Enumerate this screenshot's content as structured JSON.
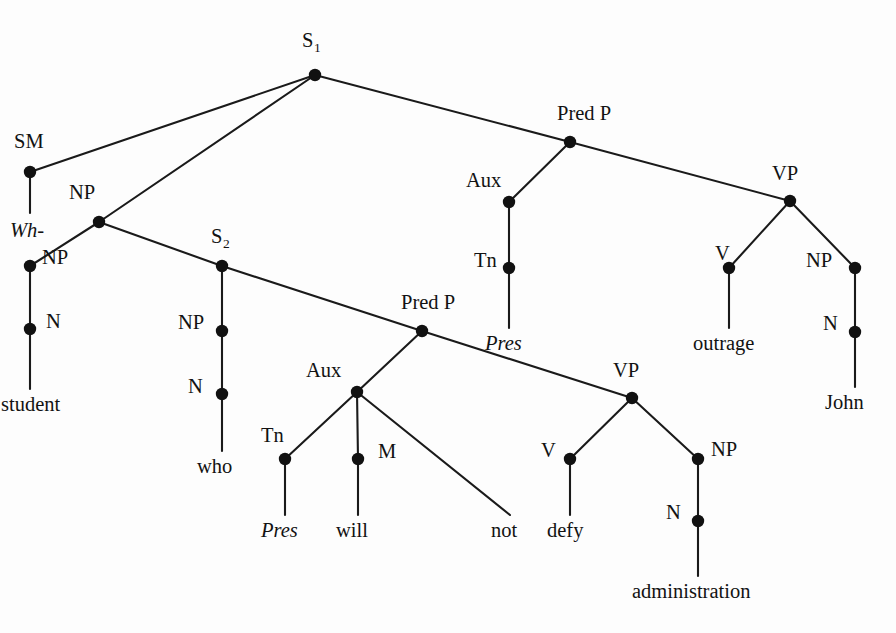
{
  "figure": {
    "background_color": "#fdfdfd",
    "line_color": "#1a1a1a",
    "node_color": "#111111",
    "sentence": "Wh- student who Pres will not defy administration Pres outrage John"
  },
  "nodes": {
    "s1": {
      "label": "S",
      "subscript": "1",
      "x": 315,
      "y": 75,
      "label_x": 302,
      "label_y": 30
    },
    "sm": {
      "label": "SM",
      "subscript": "",
      "x": 30,
      "y": 172,
      "label_x": 14,
      "label_y": 131
    },
    "np_upper": {
      "label": "NP",
      "subscript": "",
      "x": 99,
      "y": 222,
      "label_x": 69,
      "label_y": 182
    },
    "np_mid": {
      "label": "NP",
      "subscript": "",
      "x": 30,
      "y": 266,
      "label_x": 42,
      "label_y": 247
    },
    "n_student": {
      "label": "N",
      "subscript": "",
      "x": 30,
      "y": 329,
      "label_x": 46,
      "label_y": 311
    },
    "s2": {
      "label": "S",
      "subscript": "2",
      "x": 222,
      "y": 266,
      "label_x": 211,
      "label_y": 226
    },
    "np_who": {
      "label": "NP",
      "subscript": "",
      "x": 222,
      "y": 331,
      "label_x": 178,
      "label_y": 312
    },
    "n_who": {
      "label": "N",
      "subscript": "",
      "x": 222,
      "y": 394,
      "label_x": 188,
      "label_y": 376
    },
    "predp_emb": {
      "label": "Pred P",
      "subscript": "",
      "x": 422,
      "y": 331,
      "label_x": 401,
      "label_y": 292
    },
    "aux_emb": {
      "label": "Aux",
      "subscript": "",
      "x": 357,
      "y": 392,
      "label_x": 306,
      "label_y": 360
    },
    "tn_emb": {
      "label": "Tn",
      "subscript": "",
      "x": 285,
      "y": 459,
      "label_x": 261,
      "label_y": 425
    },
    "m_emb": {
      "label": "M",
      "subscript": "",
      "x": 358,
      "y": 459,
      "label_x": 378,
      "label_y": 441
    },
    "vp_emb": {
      "label": "VP",
      "subscript": "",
      "x": 632,
      "y": 398,
      "label_x": 613,
      "label_y": 360
    },
    "v_defy": {
      "label": "V",
      "subscript": "",
      "x": 570,
      "y": 459,
      "label_x": 541,
      "label_y": 440
    },
    "np_admin": {
      "label": "NP",
      "subscript": "",
      "x": 698,
      "y": 459,
      "label_x": 711,
      "label_y": 439
    },
    "n_admin": {
      "label": "N",
      "subscript": "",
      "x": 698,
      "y": 521,
      "label_x": 666,
      "label_y": 502
    },
    "predp_main": {
      "label": "Pred P",
      "subscript": "",
      "x": 570,
      "y": 142,
      "label_x": 557,
      "label_y": 103
    },
    "aux_main": {
      "label": "Aux",
      "subscript": "",
      "x": 509,
      "y": 202,
      "label_x": 466,
      "label_y": 170
    },
    "tn_main": {
      "label": "Tn",
      "subscript": "",
      "x": 509,
      "y": 268,
      "label_x": 474,
      "label_y": 250
    },
    "vp_main": {
      "label": "VP",
      "subscript": "",
      "x": 790,
      "y": 201,
      "label_x": 772,
      "label_y": 163
    },
    "v_outrage": {
      "label": "V",
      "subscript": "",
      "x": 729,
      "y": 268,
      "label_x": 715,
      "label_y": 243
    },
    "np_john": {
      "label": "NP",
      "subscript": "",
      "x": 855,
      "y": 268,
      "label_x": 806,
      "label_y": 250
    },
    "n_john": {
      "label": "N",
      "subscript": "",
      "x": 855,
      "y": 332,
      "label_x": 823,
      "label_y": 313
    }
  },
  "edges": [
    {
      "from": "s1",
      "to": "sm",
      "x1": 315,
      "y1": 75,
      "x2": 30,
      "y2": 172
    },
    {
      "from": "s1",
      "to": "np_upper",
      "x1": 315,
      "y1": 75,
      "x2": 99,
      "y2": 222
    },
    {
      "from": "s1",
      "to": "predp_main",
      "x1": 315,
      "y1": 75,
      "x2": 570,
      "y2": 142
    },
    {
      "from": "sm",
      "to": "wh",
      "x1": 30,
      "y1": 172,
      "x2": 30,
      "y2": 213
    },
    {
      "from": "np_upper",
      "to": "np_mid",
      "x1": 99,
      "y1": 222,
      "x2": 30,
      "y2": 266
    },
    {
      "from": "np_upper",
      "to": "s2",
      "x1": 99,
      "y1": 222,
      "x2": 222,
      "y2": 266
    },
    {
      "from": "np_mid",
      "to": "n_student",
      "x1": 30,
      "y1": 266,
      "x2": 30,
      "y2": 329
    },
    {
      "from": "n_student",
      "to": "student",
      "x1": 30,
      "y1": 329,
      "x2": 30,
      "y2": 389
    },
    {
      "from": "s2",
      "to": "np_who",
      "x1": 222,
      "y1": 266,
      "x2": 222,
      "y2": 331
    },
    {
      "from": "s2",
      "to": "predp_emb",
      "x1": 222,
      "y1": 266,
      "x2": 422,
      "y2": 331
    },
    {
      "from": "np_who",
      "to": "n_who",
      "x1": 222,
      "y1": 331,
      "x2": 222,
      "y2": 394
    },
    {
      "from": "n_who",
      "to": "who",
      "x1": 222,
      "y1": 394,
      "x2": 222,
      "y2": 451
    },
    {
      "from": "predp_emb",
      "to": "aux_emb",
      "x1": 422,
      "y1": 331,
      "x2": 357,
      "y2": 392
    },
    {
      "from": "predp_emb",
      "to": "vp_emb",
      "x1": 422,
      "y1": 331,
      "x2": 632,
      "y2": 398
    },
    {
      "from": "aux_emb",
      "to": "tn_emb",
      "x1": 357,
      "y1": 392,
      "x2": 285,
      "y2": 459
    },
    {
      "from": "aux_emb",
      "to": "m_emb",
      "x1": 357,
      "y1": 392,
      "x2": 358,
      "y2": 459
    },
    {
      "from": "aux_emb",
      "to": "not",
      "x1": 357,
      "y1": 392,
      "x2": 510,
      "y2": 515
    },
    {
      "from": "tn_emb",
      "to": "pres_emb",
      "x1": 285,
      "y1": 459,
      "x2": 285,
      "y2": 515
    },
    {
      "from": "m_emb",
      "to": "will",
      "x1": 358,
      "y1": 459,
      "x2": 358,
      "y2": 515
    },
    {
      "from": "vp_emb",
      "to": "v_defy",
      "x1": 632,
      "y1": 398,
      "x2": 570,
      "y2": 459
    },
    {
      "from": "vp_emb",
      "to": "np_admin",
      "x1": 632,
      "y1": 398,
      "x2": 698,
      "y2": 459
    },
    {
      "from": "v_defy",
      "to": "defy",
      "x1": 570,
      "y1": 459,
      "x2": 570,
      "y2": 515
    },
    {
      "from": "np_admin",
      "to": "n_admin",
      "x1": 698,
      "y1": 459,
      "x2": 698,
      "y2": 521
    },
    {
      "from": "n_admin",
      "to": "administration",
      "x1": 698,
      "y1": 521,
      "x2": 698,
      "y2": 576
    },
    {
      "from": "predp_main",
      "to": "aux_main",
      "x1": 570,
      "y1": 142,
      "x2": 509,
      "y2": 202
    },
    {
      "from": "predp_main",
      "to": "vp_main",
      "x1": 570,
      "y1": 142,
      "x2": 790,
      "y2": 201
    },
    {
      "from": "aux_main",
      "to": "tn_main",
      "x1": 509,
      "y1": 202,
      "x2": 509,
      "y2": 268
    },
    {
      "from": "tn_main",
      "to": "pres_main",
      "x1": 509,
      "y1": 268,
      "x2": 509,
      "y2": 328
    },
    {
      "from": "vp_main",
      "to": "v_outrage",
      "x1": 790,
      "y1": 201,
      "x2": 729,
      "y2": 268
    },
    {
      "from": "vp_main",
      "to": "np_john",
      "x1": 790,
      "y1": 201,
      "x2": 855,
      "y2": 268
    },
    {
      "from": "v_outrage",
      "to": "outrage",
      "x1": 729,
      "y1": 268,
      "x2": 729,
      "y2": 328
    },
    {
      "from": "np_john",
      "to": "n_john",
      "x1": 855,
      "y1": 268,
      "x2": 855,
      "y2": 332
    },
    {
      "from": "n_john",
      "to": "john",
      "x1": 855,
      "y1": 332,
      "x2": 855,
      "y2": 387
    }
  ],
  "leaves": {
    "wh": {
      "text": "Wh-",
      "italic": true,
      "x": 10,
      "y": 220
    },
    "student": {
      "text": "student",
      "italic": false,
      "x": 1,
      "y": 394
    },
    "who": {
      "text": "who",
      "italic": false,
      "x": 197,
      "y": 456
    },
    "pres_emb": {
      "text": "Pres",
      "italic": true,
      "x": 261,
      "y": 520
    },
    "will": {
      "text": "will",
      "italic": false,
      "x": 336,
      "y": 520
    },
    "not": {
      "text": "not",
      "italic": false,
      "x": 491,
      "y": 520
    },
    "defy": {
      "text": "defy",
      "italic": false,
      "x": 547,
      "y": 520
    },
    "administration": {
      "text": "administration",
      "italic": false,
      "x": 632,
      "y": 581
    },
    "pres_main": {
      "text": "Pres",
      "italic": true,
      "x": 485,
      "y": 333
    },
    "outrage": {
      "text": "outrage",
      "italic": false,
      "x": 693,
      "y": 333
    },
    "john": {
      "text": "John",
      "italic": false,
      "x": 825,
      "y": 392
    }
  }
}
